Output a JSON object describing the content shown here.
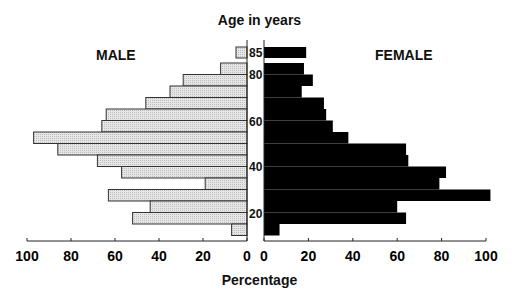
{
  "chart_data": {
    "type": "bar",
    "orientation": "horizontal-population-pyramid",
    "title": "Age in years",
    "xlabel": "Percentage",
    "ylabel": "Age in years",
    "xlim": [
      0,
      100
    ],
    "x_ticks": [
      0,
      20,
      40,
      60,
      80,
      100
    ],
    "y_tick_labels": [
      "85",
      "80",
      "60",
      "40",
      "20"
    ],
    "categories": [
      "85+",
      "80-84",
      "75-79",
      "70-74",
      "65-69",
      "60-64",
      "55-59",
      "50-54",
      "45-49",
      "40-44",
      "35-39",
      "30-34",
      "25-29",
      "20-24",
      "15-19",
      "10-14"
    ],
    "series": [
      {
        "name": "MALE",
        "side": "left",
        "color": "#d9d9d9",
        "values": [
          5,
          12,
          29,
          35,
          46,
          64,
          66,
          97,
          86,
          68,
          57,
          19,
          63,
          44,
          52,
          7
        ]
      },
      {
        "name": "FEMALE",
        "side": "right",
        "color": "#000000",
        "values": [
          19,
          18,
          22,
          17,
          27,
          28,
          31,
          38,
          64,
          65,
          82,
          79,
          102,
          60,
          64,
          7
        ]
      }
    ],
    "grid": false,
    "legend": "side labels (MALE left, FEMALE right)"
  },
  "labels": {
    "title": "Age in years",
    "male": "MALE",
    "female": "FEMALE",
    "xlabel": "Percentage"
  }
}
